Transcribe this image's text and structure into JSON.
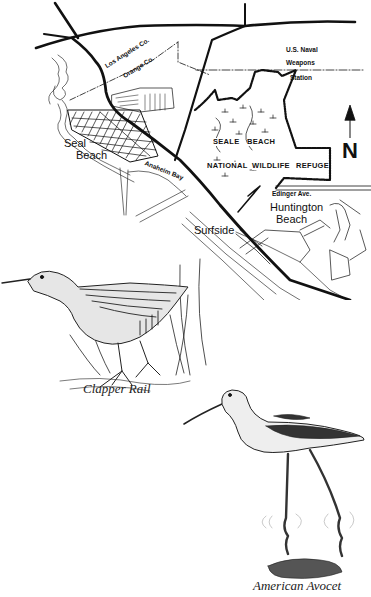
{
  "page": {
    "type": "scanned-map-page",
    "top_text_fragment": ""
  },
  "map": {
    "labels": {
      "county_line_upper": "Los Angeles Co.",
      "county_line_lower": "Orange Co.",
      "naval_line1": "U.S. Naval",
      "naval_line2": "Weapons",
      "naval_line3": "Station",
      "seal_beach_line1": "Seal",
      "seal_beach_line2": "Beach",
      "refuge_line1_a": "SEALE",
      "refuge_line1_b": "BEACH",
      "refuge_line2_a": "NATIONAL",
      "refuge_line2_b": "WILDLIFE",
      "refuge_line2_c": "REFUGE",
      "anaheim_bay": "Anaheim Bay",
      "edinger_ave": "Edinger Ave.",
      "huntington_line1": "Huntington",
      "huntington_line2": "Beach",
      "surfside": "Surfside",
      "north": "N"
    },
    "icons": {
      "north_arrow": "north-arrow-icon"
    }
  },
  "illustrations": {
    "clapper_rail": {
      "caption": "Clapper Rail"
    },
    "american_avocet": {
      "caption": "American Avocet"
    }
  }
}
